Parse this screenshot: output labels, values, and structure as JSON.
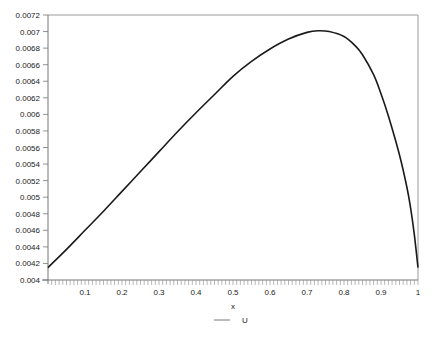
{
  "chart_data": {
    "type": "line",
    "title": "",
    "xlabel": "x",
    "ylabel": "",
    "xlim": [
      0,
      1
    ],
    "ylim": [
      0.004,
      0.0072
    ],
    "grid": false,
    "legend_position": "bottom-center",
    "x_ticks": [
      "0.1",
      "0.2",
      "0.3",
      "0.4",
      "0.5",
      "0.6",
      "0.7",
      "0.8",
      "0.9",
      "1"
    ],
    "x_tick_values": [
      0.1,
      0.2,
      0.3,
      0.4,
      0.5,
      0.6,
      0.7,
      0.8,
      0.9,
      1.0
    ],
    "y_ticks": [
      "0.004",
      "0.0042",
      "0.0044",
      "0.0046",
      "0.0048",
      "0.005",
      "0.0052",
      "0.0054",
      "0.0056",
      "0.0058",
      "0.006",
      "0.0062",
      "0.0064",
      "0.0066",
      "0.0068",
      "0.007",
      "0.0072"
    ],
    "y_tick_values": [
      0.004,
      0.0042,
      0.0044,
      0.0046,
      0.0048,
      0.005,
      0.0052,
      0.0054,
      0.0056,
      0.0058,
      0.006,
      0.0062,
      0.0064,
      0.0066,
      0.0068,
      0.007,
      0.0072
    ],
    "series": [
      {
        "name": "U",
        "color": "#1a1a1a",
        "x": [
          0.0,
          0.05,
          0.1,
          0.15,
          0.2,
          0.25,
          0.3,
          0.35,
          0.4,
          0.45,
          0.5,
          0.55,
          0.6,
          0.65,
          0.7,
          0.73,
          0.76,
          0.8,
          0.83,
          0.85,
          0.88,
          0.9,
          0.92,
          0.95,
          0.97,
          0.98,
          0.99,
          1.0
        ],
        "values": [
          0.00415,
          0.00437,
          0.0046,
          0.00483,
          0.00507,
          0.00531,
          0.00555,
          0.00579,
          0.00602,
          0.00624,
          0.00646,
          0.00664,
          0.00679,
          0.00691,
          0.00699,
          0.00701,
          0.007,
          0.00694,
          0.00683,
          0.00672,
          0.00648,
          0.00625,
          0.00598,
          0.00551,
          0.00512,
          0.00487,
          0.00455,
          0.00415
        ]
      }
    ]
  },
  "legend": {
    "label": "U"
  },
  "axis": {
    "xlabel": "x"
  }
}
